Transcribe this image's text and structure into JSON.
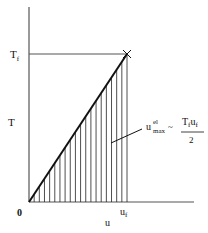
{
  "diagram": {
    "y_axis_label": "T",
    "x_axis_label": "u",
    "origin_label": "0",
    "y_tick_label": "T",
    "y_tick_sub": "f",
    "x_tick_label": "u",
    "x_tick_sub": "f",
    "formula": {
      "lhs_base": "u",
      "lhs_sup": "el",
      "lhs_sub": "max",
      "relation": "~",
      "numerator_a": "T",
      "numerator_a_sub": "f",
      "numerator_b": "u",
      "numerator_b_sub": "f",
      "denominator": "2"
    },
    "end_marker": "x",
    "hatch_count": 19,
    "line_color": "#111111",
    "axis_color": "#555555"
  }
}
